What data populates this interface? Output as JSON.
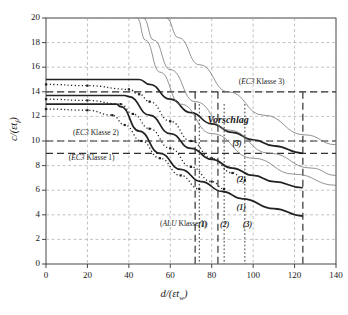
{
  "chart_data": {
    "type": "line",
    "title": "",
    "xlabel": "d/(εt_w)",
    "ylabel": "c/(εt_f)",
    "xlim": [
      0,
      140
    ],
    "ylim": [
      0,
      20
    ],
    "xticks": [
      0,
      20,
      40,
      60,
      80,
      100,
      120,
      140
    ],
    "yticks": [
      0,
      2,
      4,
      6,
      8,
      10,
      12,
      14,
      16,
      18,
      20
    ],
    "grid": true,
    "legend_position": "inline-annotations",
    "series": [
      {
        "name": "Vorschlag (3)",
        "style": "solid-thick",
        "note": "flat at c=15 until d=45, then decaying",
        "x": [
          0,
          20,
          40,
          45,
          50,
          60,
          70,
          80,
          90,
          100,
          110,
          124
        ],
        "y": [
          15.0,
          15.0,
          15.0,
          15.0,
          14.6,
          13.4,
          12.3,
          11.4,
          10.7,
          10.1,
          9.6,
          9.0
        ]
      },
      {
        "name": "Vorschlag (2)",
        "style": "solid-thick",
        "note": "flat at c=13.7 until d=40, then decaying",
        "x": [
          0,
          20,
          38,
          40,
          50,
          60,
          70,
          80,
          90,
          100,
          110,
          124
        ],
        "y": [
          13.7,
          13.7,
          13.7,
          13.6,
          12.1,
          10.6,
          9.4,
          8.5,
          7.8,
          7.2,
          6.7,
          6.2
        ]
      },
      {
        "name": "Vorschlag (1)",
        "style": "solid-thick",
        "note": "flat at c=13.0 until d=36, then decaying",
        "x": [
          0,
          20,
          34,
          36,
          45,
          55,
          65,
          75,
          85,
          95,
          110,
          124
        ],
        "y": [
          13.0,
          13.0,
          13.0,
          12.8,
          10.8,
          9.0,
          7.7,
          6.7,
          5.9,
          5.3,
          4.5,
          3.9
        ]
      },
      {
        "name": "Versuch/Rechnung (3)",
        "style": "dotted-square",
        "x": [
          0,
          20,
          40,
          45,
          50,
          60,
          70,
          80,
          90,
          96
        ],
        "y": [
          14.6,
          14.5,
          14.2,
          13.8,
          13.2,
          11.6,
          10.0,
          8.6,
          7.4,
          6.8
        ]
      },
      {
        "name": "Versuch/Rechnung (2)",
        "style": "dotted-square",
        "x": [
          0,
          20,
          36,
          42,
          50,
          60,
          70,
          80,
          86
        ],
        "y": [
          13.4,
          13.3,
          13.0,
          12.2,
          11.0,
          9.4,
          7.9,
          6.7,
          6.1
        ]
      },
      {
        "name": "Versuch/Rechnung (1)",
        "style": "dotted-square",
        "x": [
          0,
          20,
          32,
          38,
          46,
          55,
          65,
          74
        ],
        "y": [
          12.6,
          12.5,
          12.1,
          11.3,
          10.0,
          8.6,
          7.2,
          6.1
        ]
      },
      {
        "name": "Hyperbel thin a",
        "style": "solid-thin",
        "x": [
          44,
          48,
          55,
          65,
          80,
          100,
          120,
          140
        ],
        "y": [
          20.0,
          18.2,
          15.6,
          13.0,
          10.6,
          8.6,
          7.3,
          6.4
        ]
      },
      {
        "name": "Hyperbel thin b",
        "style": "solid-thin",
        "x": [
          47,
          52,
          60,
          72,
          88,
          108,
          128,
          140
        ],
        "y": [
          20.0,
          18.2,
          15.8,
          13.2,
          10.9,
          9.0,
          7.8,
          7.2
        ]
      },
      {
        "name": "Hyperbel thin c",
        "style": "solid-thin",
        "x": [
          58,
          64,
          74,
          88,
          105,
          125,
          140
        ],
        "y": [
          20.0,
          18.4,
          16.2,
          14.0,
          12.1,
          10.5,
          9.7
        ]
      }
    ],
    "reference_lines": [
      {
        "name": "EC3 Klasse 3",
        "orientation": "horizontal",
        "value": 14.0,
        "style": "dashed",
        "label": "(EC3 Klasse 3)"
      },
      {
        "name": "EC3 Klasse 2",
        "orientation": "horizontal",
        "value": 10.0,
        "style": "dashed",
        "label": "(EC3 Klasse 2)"
      },
      {
        "name": "EC3 Klasse 1",
        "orientation": "horizontal",
        "value": 9.0,
        "style": "dashed",
        "label": "(EC3 Klasse 1)"
      },
      {
        "name": "ALU Klasse 1",
        "orientation": "vertical",
        "value": 72.0,
        "style": "dashed",
        "label": "(ALU Klasse 1)"
      },
      {
        "name": "ALU Klasse 2",
        "orientation": "vertical",
        "value": 83.0,
        "style": "dashed",
        "label": "(2)"
      },
      {
        "name": "ALU Klasse 3",
        "orientation": "vertical",
        "value": 124.0,
        "style": "dashed",
        "label": "(3)"
      },
      {
        "name": "Grenze dotted 1",
        "orientation": "vertical",
        "value": 74.0,
        "style": "dotted",
        "label": "(1)"
      },
      {
        "name": "Grenze dotted 2",
        "orientation": "vertical",
        "value": 86.0,
        "style": "dotted",
        "label": "(2)"
      },
      {
        "name": "Grenze dotted 3",
        "orientation": "vertical",
        "value": 96.0,
        "style": "dotted",
        "label": "(3)"
      }
    ],
    "annotations": [
      {
        "text": "(EC3 Klasse 3)",
        "x": 93,
        "y": 14.6
      },
      {
        "text": "Vorschlag",
        "x": 78,
        "y": 11.6
      },
      {
        "text": "(EC3 Klasse 2)",
        "x": 13,
        "y": 10.5
      },
      {
        "text": "(EC3 Klasse 1)",
        "x": 11,
        "y": 8.45
      },
      {
        "text": "(ALU Klasse 1)",
        "x": 55,
        "y": 3.1
      },
      {
        "text": "(3)",
        "x": 90,
        "y": 9.6
      },
      {
        "text": "(2)",
        "x": 92,
        "y": 6.7
      },
      {
        "text": "(1)",
        "x": 92,
        "y": 4.4
      },
      {
        "text": "(1)",
        "x": 73.5,
        "y": 3.0
      },
      {
        "text": "(2)",
        "x": 84,
        "y": 3.0
      },
      {
        "text": "(3)",
        "x": 95,
        "y": 3.0
      }
    ]
  },
  "axis": {
    "ylabel_num": "c",
    "ylabel_den": "(εt",
    "ylabel_sub": "f",
    "ylabel_close": ")",
    "xlabel_num": "d",
    "xlabel_den": "(εt",
    "xlabel_sub": "w",
    "xlabel_close": ")",
    "slash": "/"
  },
  "colors": {
    "axis": "#333333",
    "grid": "#9a9a9a",
    "curve_thick": "#222222",
    "curve_thin": "#777777",
    "dashed_ref": "#333333",
    "background": "#ffffff"
  }
}
